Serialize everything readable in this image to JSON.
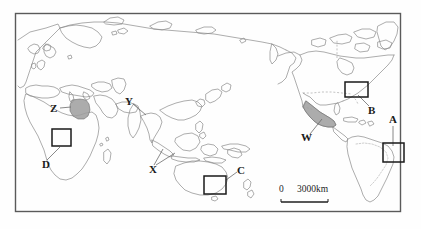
{
  "map": {
    "title": "World map with marked study regions",
    "frame": {
      "x": 15,
      "y": 13,
      "w": 386,
      "h": 199
    },
    "colors": {
      "coastline": "#8a8a8a",
      "border_dashed": "#9a9a9a",
      "frame": "#5a5a5a",
      "shaded_region": "#9e9e9e",
      "box_marker": "#1a1a1a",
      "leader_line": "#6b6b6b",
      "label_text": "#1a1a1a",
      "background": "#fefefe"
    }
  },
  "labels": [
    {
      "id": "A",
      "text": "A",
      "x": 392,
      "y": 120,
      "marker": "box",
      "marker_box": {
        "x": 383,
        "y": 143,
        "w": 21,
        "h": 19
      },
      "region": "eastern Brazil coast"
    },
    {
      "id": "B",
      "text": "B",
      "x": 371,
      "y": 111,
      "marker": "box",
      "marker_box": {
        "x": 345,
        "y": 82,
        "w": 23,
        "h": 15
      },
      "region": "northeastern United States / Great Lakes"
    },
    {
      "id": "C",
      "text": "C",
      "x": 240,
      "y": 170,
      "marker": "box",
      "marker_box": {
        "x": 204,
        "y": 176,
        "w": 22,
        "h": 18
      },
      "region": "southeastern Australia"
    },
    {
      "id": "D",
      "text": "D",
      "x": 44,
      "y": 164,
      "marker": "box",
      "marker_box": {
        "x": 52,
        "y": 129,
        "w": 19,
        "h": 17
      },
      "region": "West Africa / Gulf of Guinea"
    },
    {
      "id": "W",
      "text": "W",
      "x": 306,
      "y": 137,
      "marker": "shaded",
      "region": "Mexico"
    },
    {
      "id": "X",
      "text": "X",
      "x": 151,
      "y": 168,
      "marker": "leader",
      "region": "Indonesia (Sumatra and Java)"
    },
    {
      "id": "Y",
      "text": "Y",
      "x": 127,
      "y": 100,
      "marker": "leader",
      "region": "northeastern India / Bangladesh"
    },
    {
      "id": "Z",
      "text": "Z",
      "x": 52,
      "y": 109,
      "marker": "shaded",
      "region": "Egypt / lower Nile"
    }
  ],
  "scale_bar": {
    "zero_label": "0",
    "distance_label": "3000km",
    "zero_x": 281,
    "distance_x": 299,
    "text_y": 190,
    "bar": {
      "x": 281,
      "y": 201,
      "w": 47,
      "h": 2
    }
  }
}
